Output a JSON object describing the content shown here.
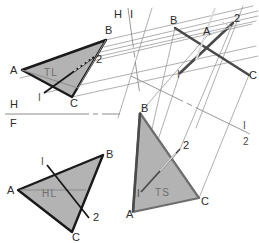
{
  "drawing": {
    "title": "Descriptive geometry: successive auxiliary views of plane ABC",
    "background_color": "#ffffff",
    "fill_color": "#b3b3b3",
    "heavy_line_color": "#1a1a1a",
    "thin_line_color": "#8c8c8c",
    "label_color": "#2b2b2b",
    "inner_label_color": "#6e6e6e"
  },
  "views": {
    "top": {
      "name": "horizontal-view",
      "inner_label": "TL",
      "vertices": [
        {
          "label": "A",
          "x": 22,
          "y": 70,
          "lx": 10,
          "ly": 74
        },
        {
          "label": "B",
          "x": 106,
          "y": 40,
          "lx": 105,
          "ly": 34
        },
        {
          "label": "C",
          "x": 72,
          "y": 97,
          "lx": 70,
          "ly": 107
        }
      ],
      "cut_line": {
        "start_label": "I",
        "end_label": "2",
        "start": {
          "x": 44,
          "y": 93
        },
        "end": {
          "x": 94,
          "y": 57
        },
        "start_label_pos": {
          "x": 38,
          "y": 101
        },
        "end_label_pos": {
          "x": 96,
          "y": 63
        }
      },
      "inner_label_pos": {
        "x": 44,
        "y": 76
      }
    },
    "aux_edge": {
      "name": "edge-view",
      "vertices": [
        {
          "label": "B",
          "x": 175,
          "y": 28,
          "lx": 170,
          "ly": 24
        },
        {
          "label": "A",
          "x": 207,
          "y": 36,
          "lx": 203,
          "ly": 35
        },
        {
          "label": "C",
          "x": 249,
          "y": 75,
          "lx": 249,
          "ly": 79
        },
        {
          "label": "2",
          "x": 233,
          "y": 23,
          "lx": 234,
          "ly": 22
        },
        {
          "label": "I",
          "x": 180,
          "y": 73,
          "lx": 177,
          "ly": 78
        }
      ]
    },
    "front": {
      "name": "frontal-view",
      "inner_label": "HL",
      "vertices": [
        {
          "label": "A",
          "x": 18,
          "y": 190,
          "lx": 7,
          "ly": 194
        },
        {
          "label": "B",
          "x": 103,
          "y": 155,
          "lx": 106,
          "ly": 158
        },
        {
          "label": "C",
          "x": 72,
          "y": 232,
          "lx": 72,
          "ly": 241
        }
      ],
      "cut_line": {
        "start_label": "I",
        "end_label": "2",
        "start": {
          "x": 47,
          "y": 165
        },
        "end": {
          "x": 89,
          "y": 218
        },
        "start_label_pos": {
          "x": 41,
          "y": 165
        },
        "end_label_pos": {
          "x": 93,
          "y": 221
        }
      },
      "inner_label_pos": {
        "x": 42,
        "y": 197
      }
    },
    "true_size": {
      "name": "true-size-view",
      "inner_label": "TS",
      "vertices": [
        {
          "label": "B",
          "x": 140,
          "y": 113,
          "lx": 141,
          "ly": 112
        },
        {
          "label": "A",
          "x": 133,
          "y": 212,
          "lx": 126,
          "ly": 218
        },
        {
          "label": "C",
          "x": 199,
          "y": 198,
          "lx": 201,
          "ly": 205
        }
      ],
      "cut_line": {
        "start_label": "I",
        "end_label": "2",
        "start": {
          "x": 141,
          "y": 192
        },
        "end": {
          "x": 180,
          "y": 149
        },
        "start_label_pos": {
          "x": 137,
          "y": 197
        },
        "end_label_pos": {
          "x": 183,
          "y": 149
        }
      },
      "inner_label_pos": {
        "x": 155,
        "y": 196
      }
    }
  },
  "fold_lines": [
    {
      "name": "hf-fold-line",
      "upper_label": "H",
      "lower_label": "F",
      "upper_label_pos": {
        "x": 10,
        "y": 108
      },
      "lower_label_pos": {
        "x": 10,
        "y": 127
      },
      "start": {
        "x": 5,
        "y": 114
      },
      "end": {
        "x": 120,
        "y": 114
      }
    },
    {
      "name": "hi-fold-line",
      "upper_label": "H",
      "lower_label": "I",
      "upper_label_pos": {
        "x": 114,
        "y": 18
      },
      "lower_label_pos": {
        "x": 130,
        "y": 18
      },
      "start": {
        "x": 128,
        "y": 8
      },
      "end": {
        "x": 140,
        "y": 96
      }
    },
    {
      "name": "i2-fold-line",
      "upper_label": "I",
      "lower_label": "2",
      "upper_label_pos": {
        "x": 243,
        "y": 129
      },
      "lower_label_pos": {
        "x": 243,
        "y": 145
      },
      "start": {
        "x": 131,
        "y": 76
      },
      "end": {
        "x": 250,
        "y": 134
      }
    }
  ]
}
